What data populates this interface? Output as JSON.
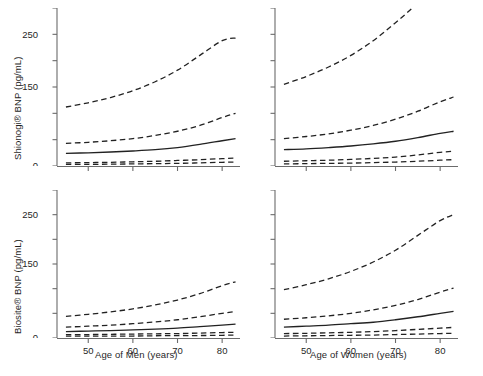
{
  "figure": {
    "width": 483,
    "height": 376,
    "background": "#ffffff",
    "line_color": "#222222",
    "axis_color": "#6b6b6b"
  },
  "chart_data": {
    "type": "line",
    "title": "",
    "panel_layout": "2x2",
    "shared_x": [
      45,
      50,
      55,
      60,
      65,
      70,
      75,
      80,
      83
    ],
    "xlim": [
      43,
      84
    ],
    "xticks": [
      50,
      60,
      70,
      80
    ],
    "xticklabels": [
      "50",
      "60",
      "70",
      "80"
    ],
    "yticks": [
      0,
      50,
      100,
      150,
      200,
      250,
      300
    ],
    "yticklabels": [
      "0",
      "",
      "",
      "150",
      "",
      "250",
      ""
    ],
    "ylabeled_ticks": [
      0,
      50,
      150,
      250
    ],
    "ylim": [
      0,
      300
    ],
    "grid": false,
    "legend": null,
    "series_names": [
      "2.5th percentile",
      "10th percentile",
      "50th percentile (median)",
      "90th percentile",
      "97.5th percentile"
    ],
    "series_styles": [
      "dashed",
      "dashed",
      "solid",
      "dashed",
      "dashed"
    ],
    "panels": [
      {
        "id": "shionogi-men",
        "row": 0,
        "col": 0,
        "ylabel": "Shionogi® BNP (pg/mL)",
        "xlabel": "Age of Men (years)",
        "series": [
          {
            "name": "2.5th percentile",
            "style": "dashed",
            "values": [
              3,
              3,
              3.5,
              4,
              4.5,
              5,
              6,
              7,
              7.5
            ]
          },
          {
            "name": "10th percentile",
            "style": "dashed",
            "values": [
              6,
              6.5,
              7,
              8,
              9,
              10.5,
              12,
              14,
              15
            ]
          },
          {
            "name": "50th percentile (median)",
            "style": "solid",
            "values": [
              24,
              25,
              26.5,
              28.5,
              31,
              35,
              41,
              48,
              52
            ]
          },
          {
            "name": "90th percentile",
            "style": "dashed",
            "values": [
              43,
              45,
              48,
              52,
              58,
              66,
              77,
              92,
              100
            ]
          },
          {
            "name": "97.5th percentile",
            "style": "dashed",
            "values": [
              112,
              120,
              130,
              143,
              160,
              182,
              210,
              238,
              243
            ]
          }
        ]
      },
      {
        "id": "shionogi-women",
        "row": 0,
        "col": 1,
        "ylabel": "",
        "xlabel": "Age of Women (years)",
        "series": [
          {
            "name": "2.5th percentile",
            "style": "dashed",
            "values": [
              4,
              4.5,
              5,
              5.5,
              6.5,
              7.5,
              9,
              11,
              12
            ]
          },
          {
            "name": "10th percentile",
            "style": "dashed",
            "values": [
              9,
              10,
              11,
              12.5,
              14.5,
              17,
              21,
              26,
              28
            ]
          },
          {
            "name": "50th percentile (median)",
            "style": "solid",
            "values": [
              31,
              32.5,
              35,
              38,
              42,
              47,
              54,
              62,
              66
            ]
          },
          {
            "name": "90th percentile",
            "style": "dashed",
            "values": [
              52,
              56,
              61,
              68,
              77,
              89,
              104,
              122,
              131
            ]
          },
          {
            "name": "97.5th percentile",
            "style": "dashed",
            "values": [
              155,
              170,
              188,
              210,
              238,
              272,
              310,
              355,
              382
            ]
          }
        ]
      },
      {
        "id": "biosite-men",
        "row": 1,
        "col": 0,
        "ylabel": "Biosite® BNP (pg/mL)",
        "xlabel": "Age of Men (years)",
        "series": [
          {
            "name": "2.5th percentile",
            "style": "dashed",
            "values": [
              4,
              4,
              4,
              4,
              4.5,
              5,
              5,
              5.5,
              6
            ]
          },
          {
            "name": "10th percentile",
            "style": "dashed",
            "values": [
              7,
              7,
              7.5,
              8,
              8.5,
              9,
              10,
              11,
              11.5
            ]
          },
          {
            "name": "50th percentile (median)",
            "style": "solid",
            "values": [
              13,
              14,
              15,
              16.5,
              18,
              20,
              23,
              26,
              28
            ]
          },
          {
            "name": "90th percentile",
            "style": "dashed",
            "values": [
              22,
              24,
              26,
              29,
              32.5,
              37,
              43,
              50,
              54
            ]
          },
          {
            "name": "97.5th percentile",
            "style": "dashed",
            "values": [
              44,
              48,
              53,
              59,
              67,
              77,
              90,
              106,
              114
            ]
          }
        ]
      },
      {
        "id": "biosite-women",
        "row": 1,
        "col": 1,
        "ylabel": "",
        "xlabel": "Age of Women (years)",
        "series": [
          {
            "name": "2.5th percentile",
            "style": "dashed",
            "values": [
              4,
              4.5,
              5,
              5.5,
              6,
              7,
              8,
              9,
              9.5
            ]
          },
          {
            "name": "10th percentile",
            "style": "dashed",
            "values": [
              9,
              9.5,
              10.5,
              11.5,
              13,
              15,
              17.5,
              20,
              21.5
            ]
          },
          {
            "name": "50th percentile (median)",
            "style": "solid",
            "values": [
              22,
              24,
              26,
              29,
              32,
              37,
              43,
              50,
              54
            ]
          },
          {
            "name": "90th percentile",
            "style": "dashed",
            "values": [
              38,
              41,
              45,
              50,
              57,
              66,
              78,
              93,
              101
            ]
          },
          {
            "name": "97.5th percentile",
            "style": "dashed",
            "values": [
              98,
              108,
              120,
              135,
              154,
              178,
              208,
              238,
              250
            ]
          }
        ]
      }
    ]
  },
  "labels": {
    "y_shionogi": "Shionogi® BNP (pg/mL)",
    "y_biosite": "Biosite® BNP (pg/mL)",
    "x_men": "Age of Men (years)",
    "x_women": "Age of Women (years)"
  },
  "caption_fragment": ""
}
